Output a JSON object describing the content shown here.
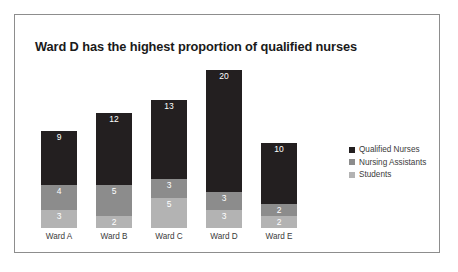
{
  "chart_data": {
    "type": "bar",
    "subtype": "stacked-bar",
    "title": "Ward D has the highest proportion of qualified nurses",
    "xlabel": "",
    "ylabel": "",
    "grid": false,
    "legend_position": "right",
    "categories": [
      "Ward A",
      "Ward B",
      "Ward C",
      "Ward D",
      "Ward E"
    ],
    "series": [
      {
        "name": "Qualified Nurses",
        "color": "#231f20",
        "values": [
          9,
          12,
          13,
          20,
          10
        ]
      },
      {
        "name": "Nursing Assistants",
        "color": "#8c8c8c",
        "values": [
          4,
          5,
          3,
          3,
          2
        ]
      },
      {
        "name": "Students",
        "color": "#b3b3b3",
        "values": [
          3,
          2,
          5,
          3,
          2
        ]
      }
    ],
    "totals": [
      16,
      19,
      21,
      26,
      14
    ],
    "ylim": [
      0,
      26
    ],
    "data_labels": true
  },
  "legend": {
    "items": [
      {
        "label": "Qualified Nurses",
        "color": "#231f20"
      },
      {
        "label": "Nursing Assistants",
        "color": "#8c8c8c"
      },
      {
        "label": "Students",
        "color": "#b3b3b3"
      }
    ]
  },
  "colors": {
    "card_background": "#ffffff",
    "card_border": "#8d8d8d",
    "title_text": "#1a1a1a",
    "axis_text": "#3b3b3b",
    "label_text": "#ffffff"
  }
}
